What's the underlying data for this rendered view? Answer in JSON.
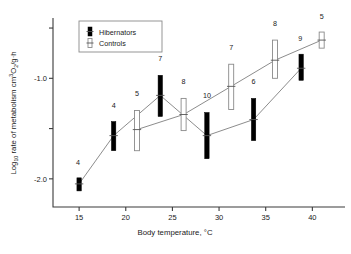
{
  "chart_data": {
    "type": "scatter",
    "title": "",
    "xlabel": "Body temperature, °C",
    "ylabel": "Log10 rate of metabolism cm3O2/g·h",
    "ylabel_parts": {
      "lead": "Log",
      "lead_sub": "10",
      "mid": " rate of metabolism cm",
      "mid_sup": "3",
      "o": "O",
      "o_sub": "2",
      "tail": "/g·h"
    },
    "xlabel_parts": {
      "text": "Body temperature, ",
      "unit": "°C"
    },
    "xlim": [
      12.2,
      43.5
    ],
    "ylim": [
      -2.28,
      -0.42
    ],
    "xticks": [
      15,
      20,
      25,
      30,
      35,
      40
    ],
    "xtick_labels": [
      "15",
      "20",
      "25",
      "30",
      "35",
      "40"
    ],
    "yticks": [
      -0.5,
      -1.0,
      -1.5,
      -2.0
    ],
    "ytick_labels": [
      "",
      "-1.0",
      "",
      "-2.0"
    ],
    "grid": false,
    "legend_position": "upper-left",
    "series": [
      {
        "name": "Hibernators",
        "style": "filled",
        "color": "#000000",
        "points": [
          {
            "x": 15.0,
            "y": -2.05,
            "low": -2.12,
            "high": -1.99,
            "n": "4",
            "n_dx": -1,
            "n_dy": -13
          },
          {
            "x": 18.7,
            "y": -1.57,
            "low": -1.72,
            "high": -1.43,
            "n": "4",
            "n_dx": 0,
            "n_dy": -14
          },
          {
            "x": 23.7,
            "y": -1.17,
            "low": -1.38,
            "high": -0.97,
            "n": "7",
            "n_dx": 0,
            "n_dy": -14
          },
          {
            "x": 28.7,
            "y": -1.57,
            "low": -1.8,
            "high": -1.34,
            "n": "10",
            "n_dx": 0,
            "n_dy": -14
          },
          {
            "x": 33.7,
            "y": -1.41,
            "low": -1.62,
            "high": -1.2,
            "n": "6",
            "n_dx": 0,
            "n_dy": -14
          },
          {
            "x": 38.8,
            "y": -0.9,
            "low": -1.02,
            "high": -0.76,
            "n": "9",
            "n_dx": -1,
            "n_dy": -13
          }
        ]
      },
      {
        "name": "Controls",
        "style": "open",
        "color": "#ffffff",
        "points": [
          {
            "x": 21.2,
            "y": -1.51,
            "low": -1.72,
            "high": -1.32,
            "n": "5",
            "n_dx": 0,
            "n_dy": -14
          },
          {
            "x": 26.2,
            "y": -1.36,
            "low": -1.52,
            "high": -1.2,
            "n": "8",
            "n_dx": 0,
            "n_dy": -14
          },
          {
            "x": 31.3,
            "y": -1.08,
            "low": -1.31,
            "high": -0.86,
            "n": "7",
            "n_dx": 0,
            "n_dy": -14
          },
          {
            "x": 36.0,
            "y": -0.82,
            "low": -1.0,
            "high": -0.62,
            "n": "8",
            "n_dx": 0,
            "n_dy": -14
          },
          {
            "x": 41.0,
            "y": -0.62,
            "low": -0.7,
            "high": -0.54,
            "n": "5",
            "n_dx": 0,
            "n_dy": -13
          }
        ]
      }
    ],
    "legend": [
      {
        "label": "Hibernators",
        "style": "filled"
      },
      {
        "label": "Controls",
        "style": "open"
      }
    ]
  }
}
